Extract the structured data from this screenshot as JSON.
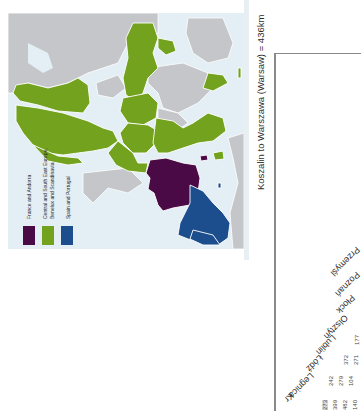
{
  "map": {
    "orientation": "rotated 90deg counter-clockwise",
    "colors": {
      "sea": "#e3eef5",
      "land_other": "#c4c6c9",
      "france_andorra": "#4a0a45",
      "central_se_europe_benelux_scandinavia": "#72a21e",
      "spain_portugal": "#1c4d8c",
      "border": "#ffffff"
    },
    "legend": [
      {
        "label": "France and Andorra",
        "color": "#4a0a45"
      },
      {
        "label_line1": "Central and South East Europe,",
        "label_line2": "Benelux and Scandinavia",
        "color": "#72a21e"
      },
      {
        "label": "Spain and Portugal",
        "color": "#1c4d8c"
      }
    ]
  },
  "distance_table": {
    "title": "Koszalin to Warszawa (Warsaw) = 436km",
    "cities": [
      "Przemyśl",
      "Poznań",
      "Płock",
      "Olsztyn",
      "Lublin",
      "Łódź",
      "Legnica",
      "Kr"
    ],
    "visible_values": [
      {
        "col": "Olsztyn",
        "values": [
          "177"
        ]
      },
      {
        "col": "Lublin",
        "values": [
          "372",
          "271"
        ]
      },
      {
        "col": "Łódź",
        "values": [
          "242",
          "279",
          "104"
        ]
      },
      {
        "col": "Legnica",
        "values": [
          "273",
          "399",
          "482",
          "140"
        ]
      }
    ]
  }
}
